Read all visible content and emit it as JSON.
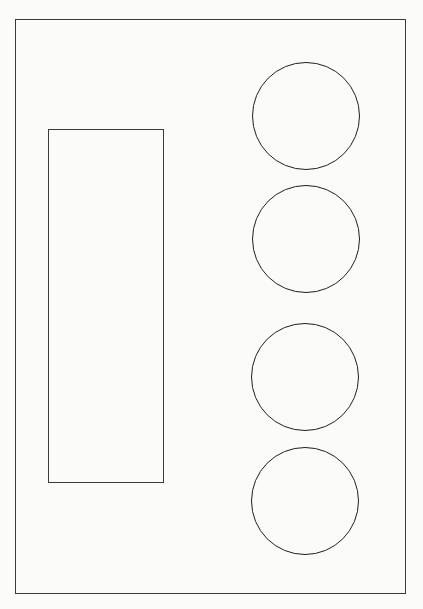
{
  "diagram": {
    "frame": {
      "left": 15,
      "top": 19,
      "width": 391,
      "height": 575
    },
    "rectangle": {
      "left": 48,
      "top": 129,
      "width": 116,
      "height": 354
    },
    "circles": [
      {
        "cx": 306,
        "cy": 116,
        "r": 54
      },
      {
        "cx": 306,
        "cy": 239,
        "r": 54
      },
      {
        "cx": 305,
        "cy": 377,
        "r": 54
      },
      {
        "cx": 305,
        "cy": 501,
        "r": 54
      }
    ],
    "stroke_color": "#2a2a2a",
    "background_color": "#fbfbfa"
  }
}
